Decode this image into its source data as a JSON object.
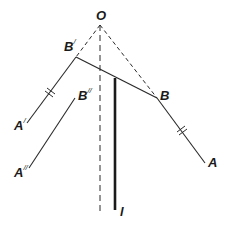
{
  "diagram": {
    "type": "geometry",
    "labels": {
      "O": "O",
      "B_prime": "B",
      "B_prime_mark": "/",
      "B": "B",
      "B_double_prime": "B",
      "B_double_prime_mark": "//",
      "A_prime": "A",
      "A_prime_mark": "/",
      "A_double_prime": "A",
      "A_double_prime_mark": "//",
      "A": "A",
      "l": "l"
    },
    "colors": {
      "stroke": "#2a2a2a",
      "background": "#ffffff"
    },
    "points": {
      "O": [
        100,
        25
      ],
      "B_prime": [
        76,
        57
      ],
      "B": [
        157,
        98
      ],
      "A_prime": [
        27,
        123
      ],
      "A": [
        205,
        163
      ],
      "B_double_prime_end": [
        75,
        98
      ],
      "A_double_prime_end": [
        29,
        168
      ],
      "l_top": [
        115,
        78
      ],
      "l_bottom": [
        115,
        210
      ],
      "axis_bottom": [
        100,
        212
      ]
    }
  }
}
